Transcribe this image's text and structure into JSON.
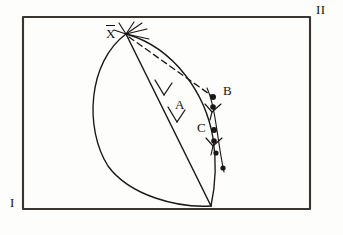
{
  "figure": {
    "kind": "hand-drawn-geometric-diagram",
    "background_color": "#fdfdfc",
    "ink_color": "#1a1713",
    "frame": {
      "name": "border-rectangle",
      "x": 23,
      "y": 17,
      "width": 287,
      "height": 192,
      "stroke_width": 2
    },
    "corner_labels": [
      {
        "id": "corner-I",
        "text": "I",
        "x": 10,
        "y": 203,
        "position": "bottom-left-outside"
      },
      {
        "id": "corner-II",
        "text": "II",
        "x": 316,
        "y": 5,
        "position": "top-right-outside"
      }
    ],
    "apex": {
      "id": "apex-X",
      "x": 126,
      "y": 34
    },
    "base": {
      "id": "base-point",
      "x": 211,
      "y": 206
    },
    "point_labels": [
      {
        "id": "label-X",
        "text": "X",
        "overbar": true,
        "x": 108,
        "y": 30
      },
      {
        "id": "label-A",
        "text": "A",
        "overbar": false,
        "x": 177,
        "y": 104
      },
      {
        "id": "label-B",
        "text": "B",
        "overbar": false,
        "x": 225,
        "y": 90
      },
      {
        "id": "label-C",
        "text": "C",
        "overbar": false,
        "x": 199,
        "y": 126
      }
    ],
    "marked_points": [
      {
        "id": "dot-B",
        "x": 213,
        "y": 97,
        "r": 3.0
      },
      {
        "id": "dot-b2",
        "x": 213,
        "y": 107,
        "r": 2.8
      },
      {
        "id": "dot-C",
        "x": 214,
        "y": 130,
        "r": 3.0
      },
      {
        "id": "dot-c2",
        "x": 214,
        "y": 141,
        "r": 2.8
      },
      {
        "id": "dot-c3",
        "x": 216,
        "y": 153,
        "r": 2.6
      },
      {
        "id": "dot-lower",
        "x": 223,
        "y": 168,
        "r": 2.6
      }
    ],
    "curves": {
      "outer_left_arc": "M126,34 C 88,62 84,128 108,166 C 130,196 178,208 211,206",
      "inner_right_arc": "M126,34 C 176,48 206,96 213,138 C 218,170 214,192 211,206",
      "dot_chain_arc": "M207,88 C 216,108 217,140 224,172",
      "chord_line": "M126,34 L 211,206",
      "dashed_line": "M128,36 L 211,96"
    },
    "arrowheads": [
      {
        "id": "chord-arrowhead-upper",
        "x": 163,
        "y": 93,
        "angle": 64
      },
      {
        "id": "chord-arrowhead-lower",
        "x": 176,
        "y": 119,
        "angle": 64
      }
    ],
    "tick_marks": [
      {
        "id": "tick-below-B",
        "x": 212,
        "y": 110,
        "label": "y-shaped-cross-tick"
      },
      {
        "id": "tick-below-C",
        "x": 213,
        "y": 144,
        "label": "y-shaped-cross-tick"
      }
    ],
    "apex_rays": [
      "M126,34 L 141,24",
      "M126,34 L 146,30",
      "M126,34 L 148,38",
      "M126,34 L 120,24",
      "M126,34 L 116,31"
    ]
  }
}
